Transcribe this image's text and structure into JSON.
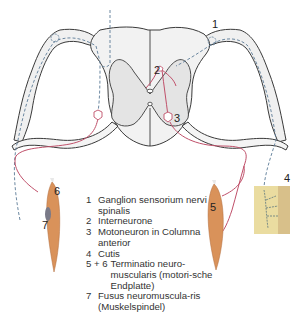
{
  "figure": {
    "type": "diagram",
    "colors": {
      "gray_matter_fill": "#ececec",
      "white_matter_fill": "#f4f4f4",
      "outline": "#3a3a3a",
      "sensory_dashed": "#5b7a96",
      "motor_red": "#c0506a",
      "muscle": "#d9925a",
      "skin": "#eadca0"
    },
    "labels": [
      {
        "id": "1",
        "text": "1"
      },
      {
        "id": "2",
        "text": "2"
      },
      {
        "id": "3",
        "text": "3"
      },
      {
        "id": "4",
        "text": "4"
      },
      {
        "id": "5",
        "text": "5"
      },
      {
        "id": "6",
        "text": "6"
      },
      {
        "id": "7",
        "text": "7"
      }
    ]
  },
  "legend": {
    "items": [
      {
        "key": "1",
        "text": "Ganglion sensorium nervi spinalis"
      },
      {
        "key": "2",
        "text": "Interneurone"
      },
      {
        "key": "3",
        "text": "Motoneuron in Columna anterior"
      },
      {
        "key": "4",
        "text": "Cutis"
      },
      {
        "key": "5 + 6",
        "text": "Terminatio neuro-muscularis (motori-sche Endplatte)"
      },
      {
        "key": "7",
        "text": "Fusus neuromuscula-ris (Muskelspindel)"
      }
    ]
  }
}
